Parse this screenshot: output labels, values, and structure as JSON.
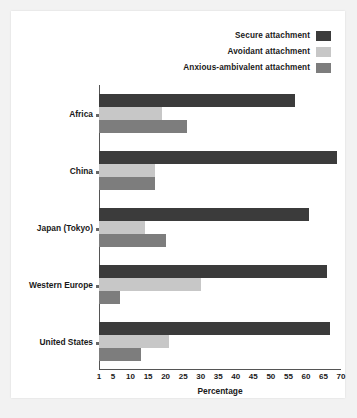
{
  "chart_data": {
    "type": "bar",
    "orientation": "horizontal",
    "title": "",
    "xlabel": "Percentage",
    "ylabel": "",
    "xlim": [
      1,
      70
    ],
    "xticks": [
      1,
      5,
      10,
      15,
      20,
      25,
      30,
      35,
      40,
      45,
      50,
      55,
      60,
      65,
      70
    ],
    "grid": false,
    "legend_position": "top-right",
    "categories": [
      "Africa",
      "China",
      "Japan (Tokyo)",
      "Western Europe",
      "United States"
    ],
    "series": [
      {
        "name": "Secure attachment",
        "color": "#3b3b3b",
        "values": [
          57,
          69,
          61,
          66,
          67
        ]
      },
      {
        "name": "Avoidant attachment",
        "color": "#c7c7c7",
        "values": [
          19,
          17,
          14,
          30,
          21
        ]
      },
      {
        "name": "Anxious-ambivalent attachment",
        "color": "#7d7d7d",
        "values": [
          26,
          17,
          20,
          7,
          13
        ]
      }
    ]
  },
  "legend": {
    "items": [
      {
        "label": "Secure attachment",
        "swatch": "secure-swatch"
      },
      {
        "label": "Avoidant attachment",
        "swatch": "avoidant-swatch"
      },
      {
        "label": "Anxious-ambivalent attachment",
        "swatch": "anxious-swatch"
      }
    ]
  },
  "axis": {
    "x_title": "Percentage"
  }
}
